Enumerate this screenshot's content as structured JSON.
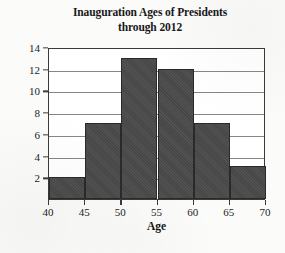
{
  "chart_data": {
    "type": "bar",
    "title": "Inauguration Ages of Presidents through 2012",
    "title_line_1": "Inauguration Ages of Presidents",
    "title_line_2": "through 2012",
    "xlabel": "Age",
    "ylabel": "Frequency",
    "categories": [
      "40-45",
      "45-50",
      "50-55",
      "55-60",
      "60-65",
      "65-70"
    ],
    "bin_edges": [
      40,
      45,
      50,
      55,
      60,
      65,
      70
    ],
    "values": [
      2,
      7,
      13,
      12,
      7,
      3
    ],
    "xlim": [
      40,
      70
    ],
    "ylim": [
      0,
      14
    ],
    "x_ticks": [
      "40",
      "45",
      "50",
      "55",
      "60",
      "65",
      "70"
    ],
    "y_ticks": [
      "2",
      "4",
      "6",
      "8",
      "10",
      "12",
      "14"
    ],
    "x_tick_values": [
      40,
      45,
      50,
      55,
      60,
      65,
      70
    ],
    "y_tick_values": [
      2,
      4,
      6,
      8,
      10,
      12,
      14
    ],
    "grid": "horizontal",
    "legend": "none",
    "bar_color": "#4a4a4a",
    "bar_edge_color": "#2a2a2a",
    "plot_background": "#ffffff",
    "figure_background": "#fbfbfa",
    "axis_color": "#3a3a3a",
    "gridline_color": "#6b6b6b"
  }
}
